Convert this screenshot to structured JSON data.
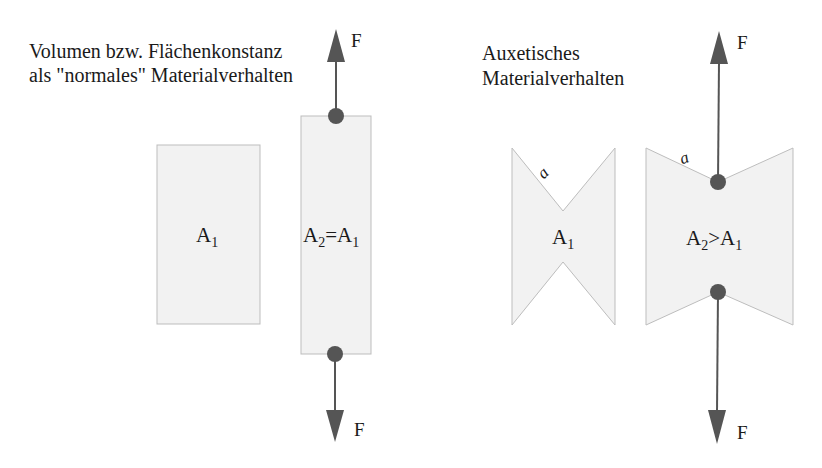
{
  "left_panel": {
    "title_lines": [
      "Volumen bzw. Flächenkonstanz",
      "als \"normales\" Materialverhalten"
    ],
    "shape_before": {
      "label": "A",
      "label_sub": "1"
    },
    "shape_after": {
      "label_parts": [
        "A",
        "2",
        "=A",
        "1"
      ]
    },
    "force_top_label": "F",
    "force_bottom_label": "F"
  },
  "right_panel": {
    "title_lines": [
      "Auxetisches",
      "Materialverhalten"
    ],
    "shape_before": {
      "label": "A",
      "label_sub": "1",
      "edge_label": "a"
    },
    "shape_after": {
      "label_parts": [
        "A",
        "2",
        ">A",
        "1"
      ],
      "edge_label": "a"
    },
    "force_top_label": "F",
    "force_bottom_label": "F"
  },
  "colors": {
    "shape_fill": "#f2f2f2",
    "shape_stroke": "#bdbdbd",
    "arrow": "#555555",
    "text": "#1a1a1a"
  }
}
